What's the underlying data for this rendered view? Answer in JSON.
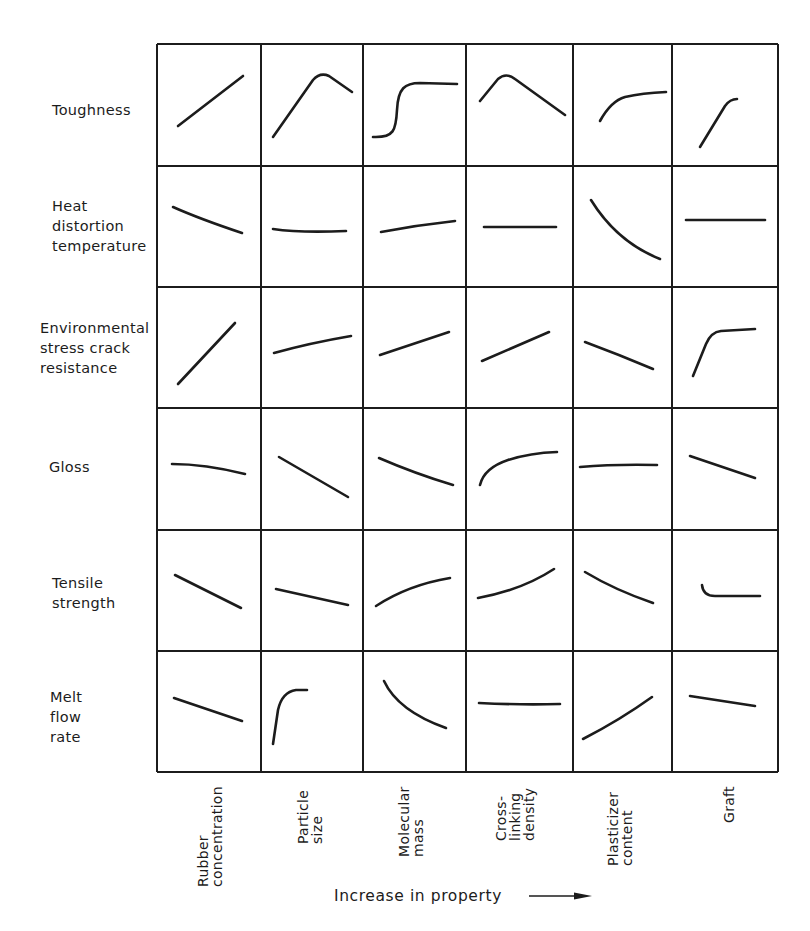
{
  "figure": {
    "rows": [
      {
        "label_lines": [
          "Toughness"
        ]
      },
      {
        "label_lines": [
          "Heat",
          "distortion",
          "temperature"
        ]
      },
      {
        "label_lines": [
          "Environmental",
          "stress crack",
          "resistance"
        ]
      },
      {
        "label_lines": [
          "Gloss"
        ]
      },
      {
        "label_lines": [
          "Tensile",
          "strength"
        ]
      },
      {
        "label_lines": [
          "Melt",
          "flow",
          "rate"
        ]
      }
    ],
    "columns": [
      {
        "label_lines": [
          "Rubber",
          "concentration"
        ]
      },
      {
        "label_lines": [
          "Particle",
          "size"
        ]
      },
      {
        "label_lines": [
          "Molecular",
          "mass"
        ]
      },
      {
        "label_lines": [
          "Cross-",
          "linking",
          "density"
        ]
      },
      {
        "label_lines": [
          "Plasticizer",
          "content"
        ]
      },
      {
        "label_lines": [
          "Graft"
        ]
      }
    ],
    "x_axis_caption": "Increase in property",
    "arrow_icon": "right-arrow",
    "line_color": "#1c1c1c"
  },
  "chart_data": {
    "type": "matrix-of-trend-sketches",
    "title": "",
    "xlabel": "Increase in property",
    "row_labels": [
      "Toughness",
      "Heat distortion temperature",
      "Environmental stress crack resistance",
      "Gloss",
      "Tensile strength",
      "Melt flow rate"
    ],
    "column_labels": [
      "Rubber concentration",
      "Particle size",
      "Molecular mass",
      "Cross-linking density",
      "Plasticizer content",
      "Graft"
    ],
    "trends": [
      [
        "increase",
        "increase then decrease",
        "sigmoidal increase",
        "increase then decrease",
        "increase, levelling off",
        "increase, levelling off"
      ],
      [
        "decrease",
        "constant",
        "slight increase",
        "constant",
        "strong decrease",
        "constant"
      ],
      [
        "increase",
        "increase",
        "increase",
        "increase",
        "decrease",
        "sharp increase then plateau"
      ],
      [
        "slight decrease",
        "decrease",
        "decrease",
        "increase, levelling off",
        "constant",
        "decrease"
      ],
      [
        "decrease",
        "slight decrease",
        "increase, levelling off",
        "increase",
        "decrease",
        "initial drop then constant"
      ],
      [
        "decrease",
        "sharp increase then plateau",
        "decrease, levelling off",
        "constant",
        "increase",
        "slight decrease"
      ]
    ],
    "curves": [
      [
        "M178,126 L243,76",
        "M273,137 L313,80 Q320,72 329,76 L352,92",
        "M373,137 C394,138 396,130 397,110 C398,88 405,83 420,83 L457,84",
        "M480,101 L498,79 Q506,72 515,79 L565,115",
        "M600,121 Q611,101 625,97 Q642,93 666,92",
        "M700,147 L725,106 Q730,99 737,99"
      ],
      [
        "M173,207 Q200,219 242,233",
        "M273,229 Q300,233 346,231",
        "M381,232 Q418,225 455,221",
        "M484,227 L556,227",
        "M591,200 Q617,242 660,259",
        "M686,220 L765,220"
      ],
      [
        "M178,384 L235,323",
        "M274,353 Q310,343 351,336",
        "M380,355 L449,332",
        "M482,361 L549,332",
        "M585,342 Q620,355 653,369",
        "M693,376 L706,344 Q711,332 721,331 L755,329"
      ],
      [
        "M172,464 Q205,464 245,474",
        "M279,457 L348,497",
        "M379,458 Q416,474 453,485",
        "M480,485 Q484,468 508,460 Q530,453 557,452",
        "M580,467 Q615,464 657,465",
        "M690,456 L755,478"
      ],
      [
        "M175,575 L241,608",
        "M276,589 L348,605",
        "M376,606 Q408,585 450,578",
        "M478,598 Q522,590 554,569",
        "M585,572 Q615,590 653,603",
        "M702,585 Q703,596 715,596 L760,596"
      ],
      [
        "M174,698 L242,721",
        "M273,744 L278,710 Q282,692 296,690 L307,690",
        "M384,681 Q398,711 446,728",
        "M479,703 Q520,705 560,704",
        "M583,739 Q620,720 652,697",
        "M690,696 L755,706"
      ]
    ],
    "grid": {
      "x": [
        157,
        261,
        363,
        466,
        573,
        672,
        778
      ],
      "y": [
        44,
        166,
        287,
        408,
        530,
        651,
        772
      ]
    }
  }
}
